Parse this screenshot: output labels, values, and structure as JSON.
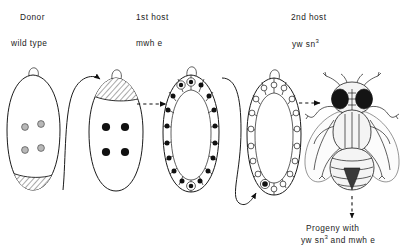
{
  "figure": {
    "type": "biology-diagram",
    "columns": [
      {
        "title": "Donor",
        "genotype": "wild type"
      },
      {
        "title": "1st host",
        "genotype": "mwh e"
      },
      {
        "title": "2nd host",
        "genotype": "yw sn",
        "genotype_sup": "3"
      }
    ],
    "progeny": {
      "line1": "Progeny with",
      "line2_pre": "yw sn",
      "line2_sup": "3",
      "line2_post": " and  mwh e"
    },
    "stages": [
      {
        "name": "donor-embryo",
        "label": "Donor",
        "nuclei": 4,
        "nuclei_style": "gray-circles",
        "pole_region": "hatched-posterior"
      },
      {
        "name": "first-host-embryo",
        "label": "1st host",
        "nuclei": 4,
        "nuclei_style": "black-dots",
        "pole_region": "hatched-anterior-graft"
      },
      {
        "name": "first-host-blastoderm",
        "label": "1st host blastoderm",
        "nuclei_style": "cellular-blastoderm-dark",
        "pole_cells": 3
      },
      {
        "name": "second-host-blastoderm",
        "label": "2nd host blastoderm",
        "nuclei_style": "cellular-blastoderm-open",
        "pole_cells": 1
      },
      {
        "name": "adult-fly",
        "label": "Adult fly",
        "view": "dorsal"
      }
    ],
    "arrows": [
      {
        "name": "pole-cell-transfer-arrow-1",
        "style": "curved-solid",
        "from": "donor-embryo-posterior",
        "to": "first-host-embryo-anterior"
      },
      {
        "name": "development-arrow-1",
        "style": "dashed-straight",
        "from": "first-host-embryo",
        "to": "first-host-blastoderm"
      },
      {
        "name": "pole-cell-transfer-arrow-2",
        "style": "curved-solid",
        "from": "first-host-blastoderm-posterior",
        "to": "second-host-blastoderm-posterior"
      },
      {
        "name": "development-arrow-2",
        "style": "dashed-straight",
        "from": "second-host-blastoderm",
        "to": "adult-fly"
      },
      {
        "name": "progeny-arrow",
        "style": "dashed-vertical",
        "from": "adult-fly",
        "to": "progeny-label"
      }
    ],
    "colors": {
      "ink": "#1b1b1b",
      "paper": "#ffffff",
      "nucleus_gray": "#b8b8b8",
      "nucleus_dark": "#111111"
    }
  }
}
